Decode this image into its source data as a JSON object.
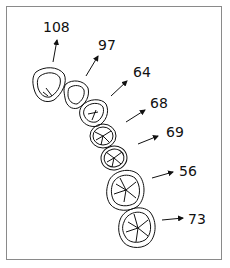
{
  "figure": {
    "labels": [
      {
        "id": "t1",
        "value": "108"
      },
      {
        "id": "t2",
        "value": "97"
      },
      {
        "id": "t3",
        "value": "64"
      },
      {
        "id": "t4",
        "value": "68"
      },
      {
        "id": "t5",
        "value": "69"
      },
      {
        "id": "t6",
        "value": "56"
      },
      {
        "id": "t7",
        "value": "73"
      }
    ],
    "colors": {
      "line": "#111111",
      "frame": "#8a8a8a",
      "background": "#ffffff"
    }
  }
}
